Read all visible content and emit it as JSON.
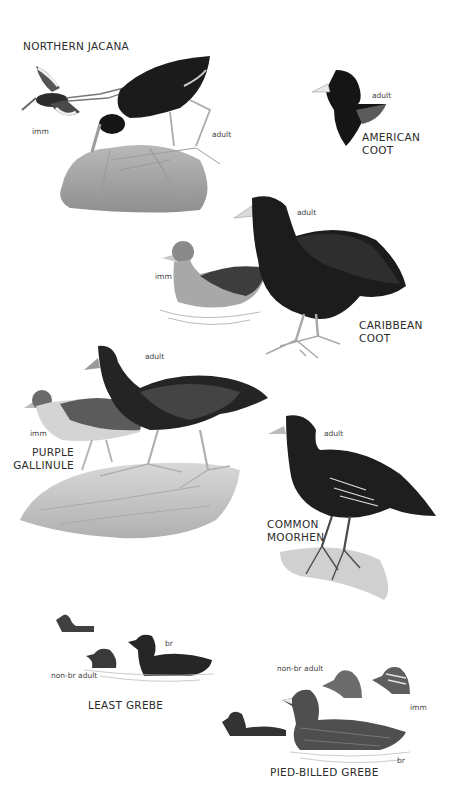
{
  "plate": {
    "species": [
      {
        "id": "northern-jacana",
        "name": "NORTHERN JACANA",
        "ages": [
          {
            "label": "imm"
          },
          {
            "label": "adult"
          }
        ]
      },
      {
        "id": "american-coot",
        "name": "AMERICAN\nCOOT",
        "ages": [
          {
            "label": "adult"
          }
        ]
      },
      {
        "id": "caribbean-coot",
        "name": "CARIBBEAN\nCOOT",
        "ages": [
          {
            "label": "adult"
          },
          {
            "label": "imm"
          }
        ]
      },
      {
        "id": "purple-gallinule",
        "name": "PURPLE\nGALLINULE",
        "ages": [
          {
            "label": "adult"
          },
          {
            "label": "imm"
          }
        ]
      },
      {
        "id": "common-moorhen",
        "name": "COMMON\nMOORHEN",
        "ages": [
          {
            "label": "adult"
          }
        ]
      },
      {
        "id": "least-grebe",
        "name": "LEAST GREBE",
        "ages": [
          {
            "label": "br"
          },
          {
            "label": "non-br adult"
          }
        ]
      },
      {
        "id": "pied-billed-grebe",
        "name": "PIED-BILLED GREBE",
        "ages": [
          {
            "label": "non-br adult"
          },
          {
            "label": "imm"
          },
          {
            "label": "br"
          }
        ]
      }
    ]
  }
}
